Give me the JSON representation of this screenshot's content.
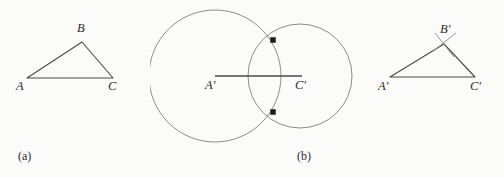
{
  "figure": {
    "width": 504,
    "height": 177,
    "background_color": "#fbfbfa",
    "stroke_color": "#6f6f72",
    "line_color": "#4a4a4d",
    "text_color": "#2b2b2b",
    "dot_color": "#1c1c1c"
  },
  "panels": [
    {
      "id": "a",
      "caption": "(a)",
      "kind": "triangle",
      "description": "original triangle ABC",
      "vertices": [
        {
          "label": "A",
          "x": 27,
          "y": 78,
          "label_x": 16,
          "label_y": 79
        },
        {
          "label": "B",
          "x": 82,
          "y": 42,
          "label_x": 77,
          "label_y": 21
        },
        {
          "label": "C",
          "x": 113,
          "y": 78,
          "label_x": 108,
          "label_y": 79
        }
      ],
      "edges": [
        [
          0,
          1
        ],
        [
          1,
          2
        ],
        [
          2,
          0
        ]
      ]
    },
    {
      "id": "b",
      "caption": "(b)",
      "kind": "circles",
      "description": "two compass circles intersecting on segment A'C'",
      "segment": {
        "x1": 215,
        "y1": 76,
        "x2": 302,
        "y2": 76
      },
      "circles": [
        {
          "name": "circle-centered-at-A",
          "cx": 215,
          "cy": 76,
          "r": 66
        },
        {
          "name": "circle-centered-at-C",
          "cx": 300,
          "cy": 76,
          "r": 52
        }
      ],
      "intersection_points": [
        {
          "name": "upper-intersection",
          "x": 273,
          "y": 40
        },
        {
          "name": "lower-intersection",
          "x": 273,
          "y": 112
        }
      ],
      "labels": [
        {
          "label": "A'",
          "label_x": 205,
          "label_y": 78
        },
        {
          "label": "C'",
          "label_x": 295,
          "label_y": 78
        }
      ]
    },
    {
      "id": "c",
      "caption": "(c)",
      "kind": "triangle",
      "description": "constructed congruent triangle A'B'C' with arc marks at B'",
      "vertices": [
        {
          "label": "A'",
          "x": 390,
          "y": 77,
          "label_x": 378,
          "label_y": 79
        },
        {
          "label": "B'",
          "x": 444,
          "y": 44,
          "label_x": 440,
          "label_y": 22
        },
        {
          "label": "C'",
          "x": 475,
          "y": 77,
          "label_x": 470,
          "label_y": 79
        }
      ],
      "edges": [
        [
          0,
          1
        ],
        [
          1,
          2
        ],
        [
          2,
          0
        ]
      ],
      "arc_marks": [
        {
          "name": "arc-mark-left",
          "x1": 432,
          "y1": 52,
          "x2": 456,
          "y2": 33
        },
        {
          "name": "arc-mark-right",
          "x1": 435,
          "y1": 33,
          "x2": 454,
          "y2": 57
        }
      ]
    }
  ]
}
